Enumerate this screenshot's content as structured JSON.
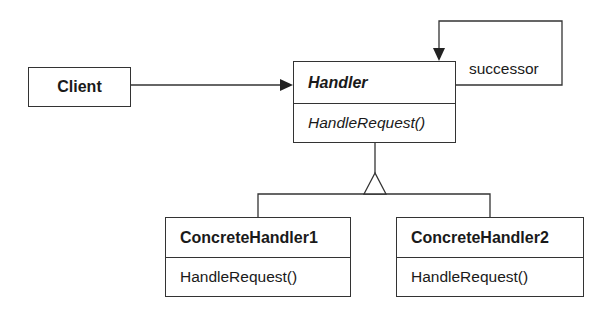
{
  "diagram": {
    "type": "UML class diagram",
    "classes": [
      {
        "id": "client",
        "name": "Client",
        "abstract": false,
        "operations": []
      },
      {
        "id": "handler",
        "name": "Handler",
        "abstract": true,
        "operations": [
          "HandleRequest()"
        ]
      },
      {
        "id": "concrete1",
        "name": "ConcreteHandler1",
        "abstract": false,
        "operations": [
          "HandleRequest()"
        ]
      },
      {
        "id": "concrete2",
        "name": "ConcreteHandler2",
        "abstract": false,
        "operations": [
          "HandleRequest()"
        ]
      }
    ],
    "relations": [
      {
        "from": "Client",
        "to": "Handler",
        "kind": "association",
        "label": ""
      },
      {
        "from": "Handler",
        "to": "Handler",
        "kind": "association",
        "label": "successor"
      },
      {
        "from": "ConcreteHandler1",
        "to": "Handler",
        "kind": "inheritance",
        "label": ""
      },
      {
        "from": "ConcreteHandler2",
        "to": "Handler",
        "kind": "inheritance",
        "label": ""
      }
    ],
    "labels": {
      "client": "Client",
      "handler": "Handler",
      "handler_op": "HandleRequest()",
      "concrete1": "ConcreteHandler1",
      "concrete1_op": "HandleRequest()",
      "concrete2": "ConcreteHandler2",
      "concrete2_op": "HandleRequest()",
      "successor": "successor"
    },
    "colors": {
      "line": "#333333",
      "text": "#1a1a1a",
      "background": "#ffffff"
    }
  }
}
